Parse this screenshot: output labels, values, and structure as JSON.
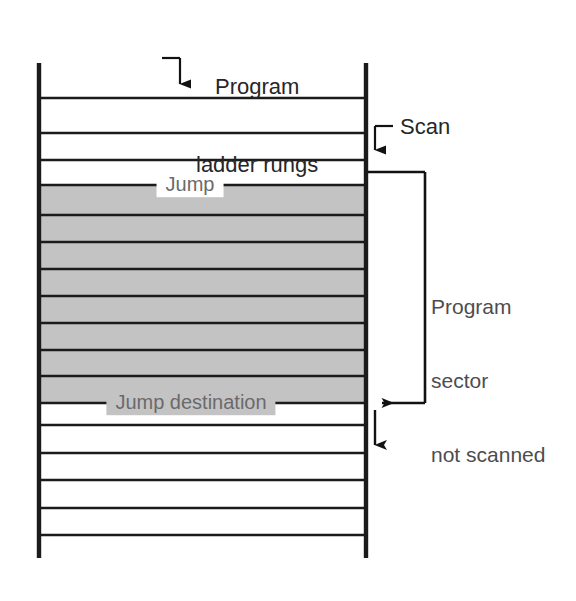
{
  "figure": {
    "background_color": "#ffffff",
    "line_color": "#1b1b1b",
    "shaded_color": "#c3c3c3",
    "text_color": "#58585a"
  },
  "annotations": {
    "program_ladder_rungs": "Program\nladder rungs",
    "program_ladder_rungs_line1": "Program",
    "program_ladder_rungs_line2": "ladder rungs",
    "scan": "Scan",
    "program_sector_not_scanned": "Program\nsector\nnot scanned",
    "program_sector_line1": "Program",
    "program_sector_line2": "sector",
    "program_sector_line3": "not scanned",
    "jump": "Jump",
    "jump_destination": "Jump destination"
  },
  "ladder": {
    "left_rail_x": 39,
    "right_rail_x": 366,
    "rail_top_y": 63,
    "rail_bottom_y": 558,
    "rung_y_positions": [
      98,
      133,
      160,
      185,
      215,
      242,
      269,
      296,
      323,
      350,
      376,
      403,
      425,
      453,
      480,
      508,
      535
    ],
    "shaded_region": {
      "top_y": 185,
      "bottom_y": 403,
      "label_top": "Jump",
      "label_bottom": "Jump destination"
    },
    "rung_count": 17,
    "unscanned_rung_count": 7
  },
  "bracket": {
    "top_y": 172,
    "bottom_y": 403,
    "right_x": 425,
    "attach_x": 366
  },
  "arrows": {
    "scan_entry": {
      "from_y": 126,
      "to_y": 163,
      "x": 375
    },
    "jump_return": {
      "from_x": 425,
      "to_x": 368,
      "y": 403
    },
    "scan_resume": {
      "from_y": 410,
      "to_y": 458,
      "x": 375
    },
    "rungs_pointer": {
      "from_y": 58,
      "to_y": 97,
      "x": 180
    }
  }
}
